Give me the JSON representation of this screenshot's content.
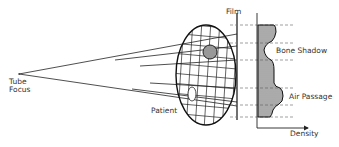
{
  "labels": {
    "tube_focus_line1": "Tube",
    "tube_focus_line2": "Focus",
    "film": "Film",
    "patient": "Patient",
    "bone_shadow": "Bone Shadow",
    "air_passage": "Air Passage",
    "density": "Density"
  },
  "colors": {
    "line": "#222222",
    "dashed": "#777777",
    "fill": "#666666",
    "bone": "#999999"
  }
}
